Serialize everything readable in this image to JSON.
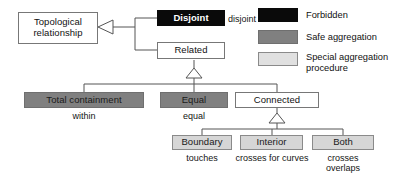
{
  "diagram": {
    "title_node": {
      "label": "Topological\nrelationship"
    },
    "nodes": {
      "disjoint": {
        "label": "Disjoint",
        "fill": "#0a0a0a",
        "text": "#ffffff"
      },
      "related": {
        "label": "Related",
        "fill": "#ffffff",
        "text": "#111111"
      },
      "total_containment": {
        "label": "Total containment",
        "fill": "#808080",
        "text": "#1a1a1a"
      },
      "equal": {
        "label": "Equal",
        "fill": "#808080",
        "text": "#1a1a1a"
      },
      "connected": {
        "label": "Connected",
        "fill": "#ffffff",
        "text": "#111111"
      },
      "boundary": {
        "label": "Boundary",
        "fill": "#d6d6d6",
        "text": "#1a1a1a"
      },
      "interior": {
        "label": "Interior",
        "fill": "#d6d6d6",
        "text": "#1a1a1a"
      },
      "both": {
        "label": "Both",
        "fill": "#d6d6d6",
        "text": "#1a1a1a"
      }
    },
    "captions": {
      "disjoint": "disjoint",
      "total_containment": "within",
      "equal": "equal",
      "boundary": "touches",
      "interior": "crosses for curves",
      "both": "crosses\noverlaps"
    }
  },
  "legend": {
    "items": [
      {
        "label": "Forbidden",
        "color": "#0a0a0a"
      },
      {
        "label": "Safe aggregation",
        "color": "#808080"
      },
      {
        "label": "Special aggregation\nprocedure",
        "color": "#e0e0e0"
      }
    ]
  }
}
